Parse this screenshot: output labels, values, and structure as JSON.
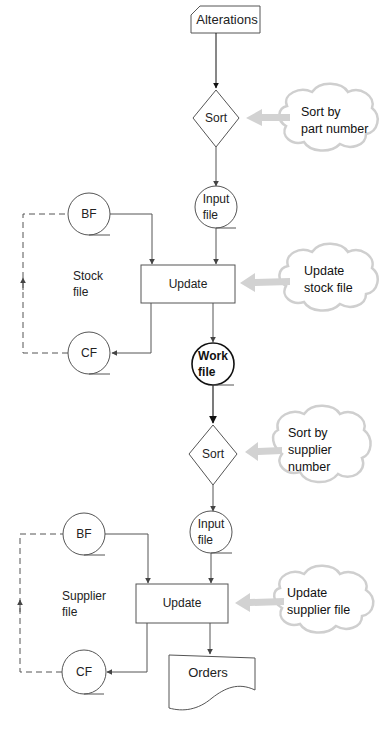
{
  "diagram": {
    "type": "system flowchart",
    "nodes": {
      "alterations": {
        "label": "Alterations",
        "shape": "punched-card"
      },
      "sort1": {
        "label": "Sort",
        "shape": "diamond"
      },
      "input_file_1": {
        "label_line1": "Input",
        "label_line2": "file",
        "shape": "disk-circle"
      },
      "bf1": {
        "label": "BF",
        "shape": "disk-circle"
      },
      "update1": {
        "label": "Update",
        "shape": "process-box"
      },
      "cf1": {
        "label": "CF",
        "shape": "disk-circle"
      },
      "stock_file_label": {
        "line1": "Stock",
        "line2": "file"
      },
      "work_file": {
        "label_line1": "Work",
        "label_line2": "file",
        "shape": "disk-circle-bold"
      },
      "sort2": {
        "label": "Sort",
        "shape": "diamond"
      },
      "input_file_2": {
        "label_line1": "Input",
        "label_line2": "file",
        "shape": "disk-circle"
      },
      "bf2": {
        "label": "BF",
        "shape": "disk-circle"
      },
      "update2": {
        "label": "Update",
        "shape": "process-box"
      },
      "cf2": {
        "label": "CF",
        "shape": "disk-circle"
      },
      "supplier_file_label": {
        "line1": "Supplier",
        "line2": "file"
      },
      "orders": {
        "label": "Orders",
        "shape": "document"
      }
    },
    "annotations": [
      {
        "line1": "Sort by",
        "line2": "part number",
        "line3": "",
        "target": "sort1"
      },
      {
        "line1": "Update",
        "line2": "stock file",
        "line3": "",
        "target": "update1"
      },
      {
        "line1": "Sort by",
        "line2": "supplier",
        "line3": "number",
        "target": "sort2"
      },
      {
        "line1": "Update",
        "line2": "supplier file",
        "line3": "",
        "target": "update2"
      }
    ],
    "colors": {
      "stroke": "#555555",
      "bold_stroke": "#111111",
      "cloud_stroke": "#c8c8c8",
      "cloud_arrow": "#cfcfcf"
    }
  }
}
